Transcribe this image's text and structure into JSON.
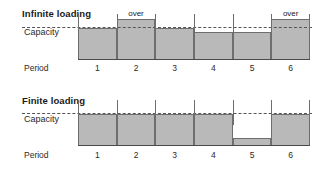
{
  "chart_data": [
    {
      "type": "bar",
      "title": "Infinite loading",
      "xlabel": "Period",
      "ylabel": "Capacity",
      "capacity_label": "Capacity",
      "period_label": "Period",
      "categories": [
        "1",
        "2",
        "3",
        "4",
        "5",
        "6"
      ],
      "values": [
        100,
        128,
        100,
        88,
        88,
        128
      ],
      "capacity": 100,
      "ylim": [
        0,
        145
      ],
      "overload_label": "over",
      "overloaded": [
        false,
        true,
        false,
        false,
        false,
        true
      ],
      "grid": false,
      "legend": "none",
      "fill_color": "#b9b9b9",
      "line_color": "#6e6e6e",
      "capacity_line_color": "#555555"
    },
    {
      "type": "bar",
      "title": "Finite loading",
      "xlabel": "Period",
      "ylabel": "Capacity",
      "capacity_label": "Capacity",
      "period_label": "Period",
      "categories": [
        "1",
        "2",
        "3",
        "4",
        "5",
        "6"
      ],
      "values": [
        100,
        100,
        100,
        100,
        26,
        100
      ],
      "capacity": 100,
      "ylim": [
        0,
        145
      ],
      "overload_label": "over",
      "overloaded": [
        false,
        false,
        false,
        false,
        false,
        false
      ],
      "grid": false,
      "legend": "none",
      "fill_color": "#b9b9b9",
      "line_color": "#6e6e6e",
      "capacity_line_color": "#555555"
    }
  ]
}
